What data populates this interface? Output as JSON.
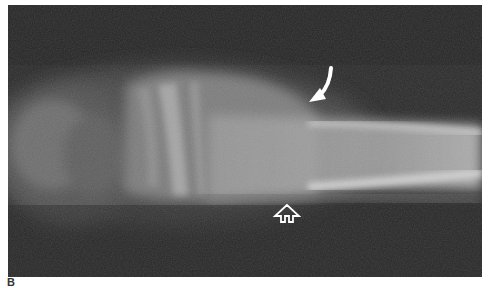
{
  "figure": {
    "panel_label": "B",
    "image_type": "radiograph",
    "background_color": "#2a2a2a",
    "annotations": [
      {
        "type": "curved-arrow",
        "color": "#ffffff",
        "direction": "down-left"
      },
      {
        "type": "open-arrow",
        "color": "#ffffff",
        "direction": "up"
      }
    ]
  }
}
